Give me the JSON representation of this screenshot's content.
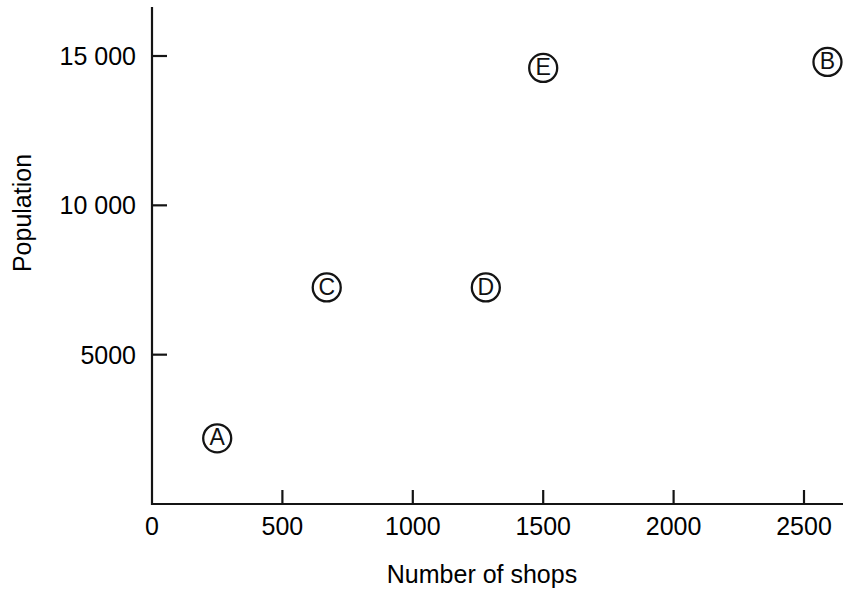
{
  "chart_data": {
    "type": "scatter",
    "title": "",
    "xlabel": "Number of shops",
    "ylabel": "Population",
    "xlim": [
      0,
      2650
    ],
    "ylim": [
      0,
      16200
    ],
    "grid": false,
    "legend": "none",
    "x_ticks": [
      {
        "value": 0,
        "label": "0"
      },
      {
        "value": 500,
        "label": "500"
      },
      {
        "value": 1000,
        "label": "1000"
      },
      {
        "value": 1500,
        "label": "1500"
      },
      {
        "value": 2000,
        "label": "2000"
      },
      {
        "value": 2500,
        "label": "2500"
      }
    ],
    "y_ticks": [
      {
        "value": 5000,
        "label": "5000"
      },
      {
        "value": 10000,
        "label": "10 000"
      },
      {
        "value": 15000,
        "label": "15 000"
      }
    ],
    "points": [
      {
        "label": "A",
        "x": 250,
        "y": 2200
      },
      {
        "label": "B",
        "x": 2590,
        "y": 14800
      },
      {
        "label": "C",
        "x": 670,
        "y": 7250
      },
      {
        "label": "D",
        "x": 1280,
        "y": 7250
      },
      {
        "label": "E",
        "x": 1500,
        "y": 14600
      }
    ],
    "marker_style": "circled-letter",
    "marker_radius_px": 14,
    "colors": {
      "axis": "#141414",
      "marker_stroke": "#141414",
      "marker_fill": "#ffffff",
      "text": "#000000",
      "background": "#ffffff"
    }
  }
}
